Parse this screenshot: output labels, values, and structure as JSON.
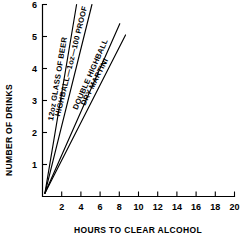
{
  "chart_data": {
    "type": "line",
    "title": "",
    "xlabel": "HOURS TO CLEAR ALCOHOL",
    "ylabel": "NUMBER OF DRINKS",
    "xlim": [
      0,
      20
    ],
    "ylim": [
      0,
      6
    ],
    "xticks": [
      2,
      4,
      6,
      8,
      10,
      12,
      14,
      16,
      18,
      20
    ],
    "yticks": [
      1,
      2,
      3,
      4,
      5,
      6
    ],
    "xtick_labels": [
      "2",
      "4",
      "6",
      "8",
      "10",
      "12",
      "14",
      "16",
      "18",
      "20"
    ],
    "ytick_labels": [
      "1",
      "2",
      "3",
      "4",
      "5",
      "6"
    ],
    "grid": false,
    "legend": "inline-labels",
    "origin": {
      "x": 0.25,
      "y": 0.1
    },
    "series": [
      {
        "name": "12oz GLASS OF BEER",
        "label": "12oz GLASS OF BEER",
        "hours_per_drink": 0.55,
        "x": [
          0.25,
          3.55
        ],
        "y": [
          0.1,
          6.0
        ]
      },
      {
        "name": "HIGHBALL—1oz—100 PROOF",
        "label": "HIGHBALL—1oz—100 PROOF",
        "hours_per_drink": 0.83,
        "x": [
          0.25,
          5.15
        ],
        "y": [
          0.1,
          6.0
        ]
      },
      {
        "name": "DOUBLE HIGHBALL",
        "label": "DOUBLE HIGHBALL",
        "hours_per_drink": 1.66,
        "x": [
          0.25,
          8.05
        ],
        "y": [
          0.1,
          5.4
        ]
      },
      {
        "name": "DRY MARTINI",
        "label": "DRY MARTINI",
        "hours_per_drink": 1.96,
        "x": [
          0.25,
          8.65
        ],
        "y": [
          0.1,
          5.05
        ]
      }
    ]
  },
  "colors": {
    "ink": "#000000",
    "background": "#ffffff"
  }
}
